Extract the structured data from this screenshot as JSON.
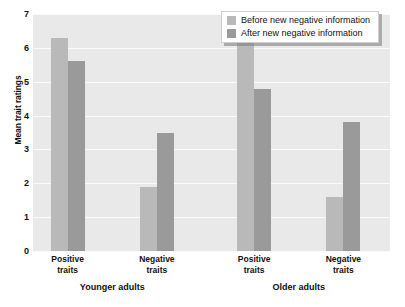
{
  "chart_data": {
    "type": "bar",
    "title": "",
    "xlabel": "",
    "ylabel": "Mean trait ratings",
    "ylim": [
      0,
      7
    ],
    "yticks": [
      0,
      1,
      2,
      3,
      4,
      5,
      6,
      7
    ],
    "grid": true,
    "legend_position": "top-right",
    "categories": [
      "Positive traits",
      "Negative traits",
      "Positive traits",
      "Negative traits"
    ],
    "category_lines": [
      [
        "Positive",
        "traits"
      ],
      [
        "Negative",
        "traits"
      ],
      [
        "Positive",
        "traits"
      ],
      [
        "Negative",
        "traits"
      ]
    ],
    "groups": [
      {
        "label": "Younger adults",
        "categories": [
          0,
          1
        ]
      },
      {
        "label": "Older adults",
        "categories": [
          2,
          3
        ]
      }
    ],
    "series": [
      {
        "name": "Before new negative information",
        "color": "#b9b9b9",
        "values": [
          6.3,
          1.9,
          6.3,
          1.6
        ]
      },
      {
        "name": "After new negative information",
        "color": "#9a9a9a",
        "values": [
          5.6,
          3.5,
          4.8,
          3.8
        ]
      }
    ]
  },
  "axis": {
    "y_title": "Mean trait ratings",
    "y_tick_labels": [
      "7",
      "6",
      "5",
      "4",
      "3",
      "2",
      "1",
      "0"
    ]
  },
  "legend": {
    "items": [
      {
        "label": "Before new negative information",
        "swatch": "before"
      },
      {
        "label": "After new negative information",
        "swatch": "after"
      }
    ]
  },
  "colors": {
    "before": "#b9b9b9",
    "after": "#9a9a9a",
    "plot_background": "#e9e9e9",
    "gridline": "#fbfbfb",
    "text": "#111111"
  }
}
